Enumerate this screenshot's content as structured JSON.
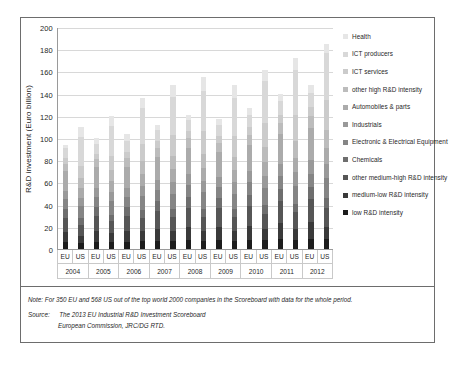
{
  "chart_data": {
    "type": "bar",
    "stacked": true,
    "title": "",
    "xlabel": "",
    "ylabel": "R&D investment (Euro billion)",
    "ylim": [
      0,
      200
    ],
    "ytick_step": 20,
    "yticks": [
      "200",
      "180",
      "160",
      "140",
      "120",
      "100",
      "80",
      "60",
      "40",
      "20",
      "0"
    ],
    "grid": true,
    "legend_position": "right",
    "groups": [
      "2004",
      "2005",
      "2006",
      "2007",
      "2008",
      "2009",
      "2010",
      "2011",
      "2012"
    ],
    "region_labels": [
      "EU",
      "US"
    ],
    "categories": [
      "2004 EU",
      "2004 US",
      "2005 EU",
      "2005 US",
      "2006 EU",
      "2006 US",
      "2007 EU",
      "2007 US",
      "2008 EU",
      "2008 US",
      "2009 EU",
      "2009 US",
      "2010 EU",
      "2010 US",
      "2011 EU",
      "2011 US",
      "2012 EU",
      "2012 US"
    ],
    "totals": [
      94,
      110,
      100,
      120,
      104,
      136,
      112,
      148,
      121,
      155,
      117,
      148,
      127,
      161,
      140,
      172,
      148,
      185
    ],
    "series": [
      {
        "name": "low R&D intensity",
        "color": "#1c1c1c",
        "values": [
          6,
          5,
          6,
          6,
          6,
          7,
          7,
          7,
          8,
          7,
          8,
          7,
          8,
          8,
          9,
          8,
          9,
          9
        ]
      },
      {
        "name": "medium-low R&D intensity",
        "color": "#3a3a3a",
        "values": [
          9,
          7,
          10,
          8,
          10,
          9,
          11,
          9,
          12,
          9,
          12,
          9,
          13,
          10,
          14,
          10,
          15,
          11
        ]
      },
      {
        "name": "other medium-high R&D intensity",
        "color": "#565656",
        "values": [
          13,
          10,
          14,
          11,
          14,
          12,
          16,
          13,
          17,
          13,
          17,
          13,
          18,
          14,
          20,
          15,
          21,
          17
        ]
      },
      {
        "name": "Chemicals",
        "color": "#6e6e6e",
        "values": [
          8,
          6,
          8,
          6,
          8,
          7,
          9,
          7,
          10,
          7,
          9,
          7,
          10,
          8,
          11,
          8,
          11,
          9
        ]
      },
      {
        "name": "Electronic & Electrical Equipment",
        "color": "#858585",
        "values": [
          9,
          11,
          9,
          12,
          9,
          13,
          10,
          14,
          11,
          15,
          10,
          14,
          11,
          15,
          12,
          16,
          12,
          18
        ]
      },
      {
        "name": "Industrials",
        "color": "#999999",
        "values": [
          7,
          7,
          8,
          8,
          8,
          9,
          9,
          10,
          10,
          10,
          9,
          10,
          10,
          11,
          11,
          12,
          12,
          13
        ]
      },
      {
        "name": "Automobiles & parts",
        "color": "#ababab",
        "values": [
          18,
          9,
          19,
          10,
          19,
          11,
          21,
          12,
          23,
          12,
          22,
          11,
          24,
          12,
          27,
          13,
          29,
          14
        ]
      },
      {
        "name": "other high R&D intensity",
        "color": "#bcbcbc",
        "values": [
          7,
          9,
          7,
          10,
          8,
          11,
          8,
          12,
          9,
          13,
          9,
          12,
          9,
          14,
          10,
          15,
          11,
          16
        ]
      },
      {
        "name": "ICT services",
        "color": "#cbcbcb",
        "values": [
          5,
          11,
          5,
          13,
          5,
          16,
          6,
          19,
          6,
          20,
          6,
          19,
          7,
          22,
          7,
          24,
          8,
          27
        ]
      },
      {
        "name": "ICT producers",
        "color": "#d8d8d8",
        "values": [
          9,
          26,
          9,
          27,
          10,
          32,
          10,
          34,
          10,
          36,
          10,
          34,
          11,
          37,
          12,
          40,
          13,
          43
        ]
      },
      {
        "name": "Health",
        "color": "#e6e6e6",
        "values": [
          3,
          9,
          5,
          9,
          7,
          9,
          5,
          11,
          5,
          13,
          5,
          12,
          6,
          10,
          7,
          11,
          7,
          8
        ]
      }
    ]
  },
  "legend": {
    "items": [
      {
        "label": "Health",
        "color": "#e6e6e6"
      },
      {
        "label": "ICT producers",
        "color": "#d8d8d8"
      },
      {
        "label": "ICT services",
        "color": "#cbcbcb"
      },
      {
        "label": "other high R&D intensity",
        "color": "#bcbcbc"
      },
      {
        "label": "Automobiles & parts",
        "color": "#ababab"
      },
      {
        "label": "Industrials",
        "color": "#999999"
      },
      {
        "label": "Electronic & Electrical Equipment",
        "color": "#858585"
      },
      {
        "label": "Chemicals",
        "color": "#6e6e6e"
      },
      {
        "label": "other medium-high R&D intensity",
        "color": "#565656"
      },
      {
        "label": "medium-low R&D intensity",
        "color": "#3a3a3a"
      },
      {
        "label": "low R&D intensity",
        "color": "#1c1c1c"
      }
    ]
  },
  "footnotes": {
    "note_label": "Note:",
    "note_text": "For 350 EU and 568 US out of the top world 2000 companies in the Scoreboard with data for the whole period.",
    "source_label": "Source:",
    "source_line1": "The 2013 EU Industrial R&D Investment Scoreboard",
    "source_line2": "European Commission, JRC/DG RTD."
  }
}
